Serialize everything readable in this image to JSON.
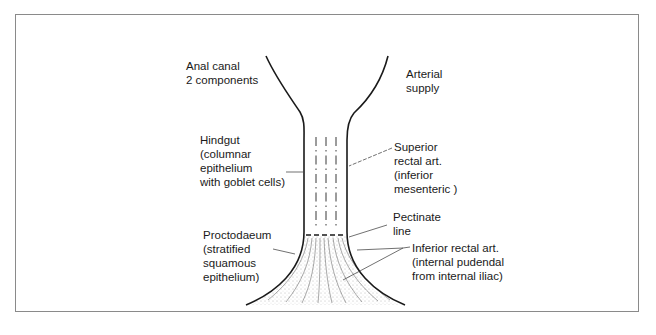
{
  "diagram": {
    "title_line1": "Anal canal",
    "title_line2": "2 components",
    "arterial_supply_line1": "Arterial",
    "arterial_supply_line2": "supply",
    "hindgut": {
      "line1": "Hindgut",
      "line2": "(columnar",
      "line3": "epithelium",
      "line4": "with goblet cells)"
    },
    "superior_rectal": {
      "line1": "Superior",
      "line2": "rectal art.",
      "line3": "(inferior",
      "line4": "mesenteric )"
    },
    "pectinate": {
      "line1": "Pectinate",
      "line2": "line"
    },
    "proctodaeum": {
      "line1": "Proctodaeum",
      "line2": "(stratified",
      "line3": "squamous",
      "line4": "epithelium)"
    },
    "inferior_rectal": {
      "line1": "Inferior rectal art.",
      "line2": "(internal pudendal",
      "line3": "from internal iliac)"
    },
    "colors": {
      "stroke": "#1a1a1a",
      "frame": "#8a8a8a",
      "stipple": "#6a6a6a"
    }
  }
}
